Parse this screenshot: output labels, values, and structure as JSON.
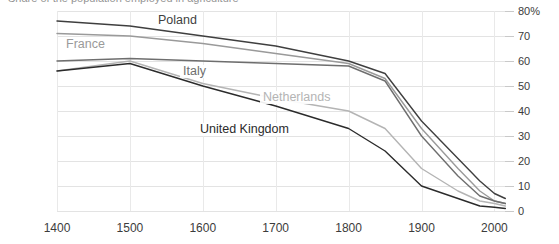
{
  "chart_data": {
    "type": "line",
    "title": "Share of the population employed in agriculture",
    "xlabel": "",
    "ylabel": "",
    "xlim": [
      1400,
      2020
    ],
    "ylim": [
      0,
      80
    ],
    "grid": true,
    "legend_position": "inline-labels",
    "x_ticks": [
      "1400",
      "1500",
      "1600",
      "1700",
      "1800",
      "1900",
      "2000"
    ],
    "y_ticks": [
      "80%",
      "70",
      "60",
      "50",
      "40",
      "30",
      "20",
      "10",
      "0"
    ],
    "y_tick_values": [
      80,
      70,
      60,
      50,
      40,
      30,
      20,
      10,
      0
    ],
    "series": [
      {
        "name": "Poland",
        "color": "#3f3f3f",
        "label_x": 155,
        "label_y": 14,
        "x": [
          1400,
          1500,
          1600,
          1700,
          1800,
          1850,
          1900,
          1950,
          1980,
          2000,
          2015
        ],
        "values": [
          76,
          74,
          70,
          66,
          60,
          55,
          36,
          21,
          12,
          7,
          5
        ]
      },
      {
        "name": "France",
        "color": "#9a9a9a",
        "label_x": 63,
        "label_y": 38,
        "x": [
          1400,
          1500,
          1600,
          1700,
          1800,
          1850,
          1900,
          1950,
          1980,
          2000,
          2015
        ],
        "values": [
          71,
          70,
          67,
          63,
          59,
          53,
          33,
          17,
          8,
          4,
          3
        ]
      },
      {
        "name": "Italy",
        "color": "#6e6e6e",
        "label_x": 180,
        "label_y": 65,
        "x": [
          1400,
          1500,
          1600,
          1700,
          1800,
          1850,
          1900,
          1950,
          1980,
          2000,
          2015
        ],
        "values": [
          60,
          61,
          60,
          59,
          58,
          52,
          30,
          14,
          6,
          4,
          3
        ]
      },
      {
        "name": "Netherlands",
        "color": "#b4b4b4",
        "label_x": 260,
        "label_y": 91,
        "x": [
          1400,
          1500,
          1600,
          1700,
          1800,
          1850,
          1900,
          1950,
          1980,
          2000,
          2015
        ],
        "values": [
          56,
          60,
          51,
          45,
          40,
          33,
          17,
          8,
          4,
          3,
          2
        ]
      },
      {
        "name": "United Kingdom",
        "color": "#2b2b2b",
        "label_x": 197,
        "label_y": 123,
        "x": [
          1400,
          1500,
          1600,
          1700,
          1800,
          1850,
          1900,
          1950,
          1980,
          2000,
          2015
        ],
        "values": [
          56,
          59,
          50,
          42,
          33,
          24,
          10,
          5,
          2,
          1.5,
          1
        ]
      }
    ]
  }
}
